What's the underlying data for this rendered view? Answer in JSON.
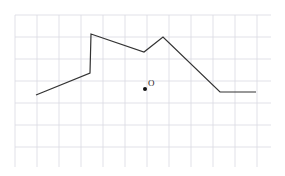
{
  "figure": {
    "title": "",
    "background_color": "#ffffff",
    "grid": {
      "visible": true,
      "color": "#d9d9e2",
      "line_width": 0.8,
      "cell_size": 22,
      "x_start": 15,
      "y_start": 15,
      "x_end": 271,
      "y_end": 167,
      "columns": 11,
      "rows": 6
    },
    "marker_point": {
      "label": "O",
      "dot_color": "#111111",
      "dot_radius": 2.0,
      "dot_x": 145,
      "dot_y": 89,
      "label_x": 148,
      "label_y": 86
    }
  },
  "chart_data": {
    "type": "line",
    "title": "",
    "xlabel": "",
    "ylabel": "",
    "grid": true,
    "legend_position": "none",
    "axis_visible": false,
    "xlim": [
      15,
      271
    ],
    "ylim": [
      167,
      15
    ],
    "series": [
      {
        "name": "polyline",
        "color": "#333333",
        "line_width": 1.2,
        "marker": "none",
        "points": [
          {
            "x": 36,
            "y": 95
          },
          {
            "x": 90,
            "y": 73
          },
          {
            "x": 91,
            "y": 34
          },
          {
            "x": 144,
            "y": 52
          },
          {
            "x": 163,
            "y": 37
          },
          {
            "x": 220,
            "y": 92
          },
          {
            "x": 256,
            "y": 92
          }
        ]
      }
    ]
  }
}
